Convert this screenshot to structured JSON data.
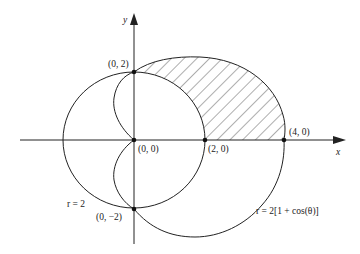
{
  "diagram": {
    "axes": {
      "x_label": "x",
      "y_label": "y"
    },
    "points": [
      {
        "id": "p02",
        "label": "(0, 2)"
      },
      {
        "id": "p00",
        "label": "(0, 0)"
      },
      {
        "id": "p20",
        "label": "(2, 0)"
      },
      {
        "id": "p40",
        "label": "(4, 0)"
      },
      {
        "id": "p0m2",
        "label": "(0, −2)"
      }
    ],
    "curves": [
      {
        "id": "circle",
        "label": "r = 2"
      },
      {
        "id": "cardioid",
        "label": "r = 2[1 + cos(θ)]"
      }
    ],
    "shaded_region": "inside cardioid, outside circle, first quadrant",
    "colors": {
      "stroke": "#222222",
      "background": "#ffffff"
    }
  }
}
